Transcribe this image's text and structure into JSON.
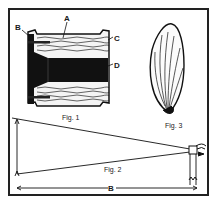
{
  "figure": {
    "fig1": {
      "caption": "Fig. 1",
      "labels": {
        "a": "A",
        "b": "B",
        "c": "C",
        "d": "D"
      }
    },
    "fig2": {
      "caption": "Fig. 2",
      "distance_label": "B"
    },
    "fig3": {
      "caption": "Fig. 3"
    }
  },
  "colors": {
    "ink": "#1a1a1a",
    "paper": "#ffffff"
  }
}
